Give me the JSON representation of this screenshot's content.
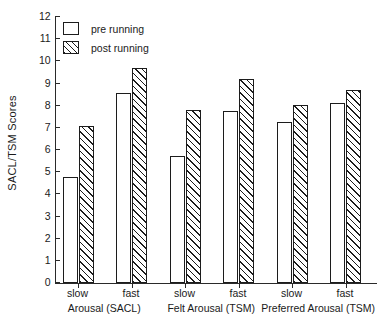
{
  "chart_data": {
    "type": "bar",
    "title": "",
    "xlabel": "",
    "ylabel": "SACL/TSM Scores",
    "ylim": [
      0,
      12
    ],
    "yticks": [
      0,
      1,
      2,
      3,
      4,
      5,
      6,
      7,
      8,
      9,
      10,
      11,
      12
    ],
    "ytick_labels": [
      "0",
      "1",
      "2",
      "3",
      "4",
      "5",
      "6",
      "7",
      "8",
      "9",
      "10",
      "11",
      "12"
    ],
    "grid": false,
    "legend_position": "top-left",
    "categories": [
      "slow",
      "fast",
      "slow",
      "fast",
      "slow",
      "fast"
    ],
    "groups": [
      {
        "name": "Arousal (SACL)",
        "categories": [
          "slow",
          "fast"
        ]
      },
      {
        "name": "Felt Arousal (TSM)",
        "categories": [
          "slow",
          "fast"
        ]
      },
      {
        "name": "Preferred Arousal (TSM)",
        "categories": [
          "slow",
          "fast"
        ]
      }
    ],
    "series": [
      {
        "name": "pre running",
        "fill": "white",
        "values": [
          4.8,
          8.55,
          5.75,
          7.75,
          7.25,
          8.1
        ]
      },
      {
        "name": "post running",
        "fill": "diagonal-hatch",
        "values": [
          7.1,
          9.7,
          7.8,
          9.2,
          8.05,
          8.7
        ]
      }
    ]
  },
  "legend": {
    "items": [
      {
        "label": "pre running",
        "swatch": "empty-square-swatch"
      },
      {
        "label": "post running",
        "swatch": "hatched-square-swatch"
      }
    ]
  },
  "colors": {
    "ink": "#1c1c1c",
    "axis": "#2a2a2a",
    "background": "#ffffff"
  }
}
